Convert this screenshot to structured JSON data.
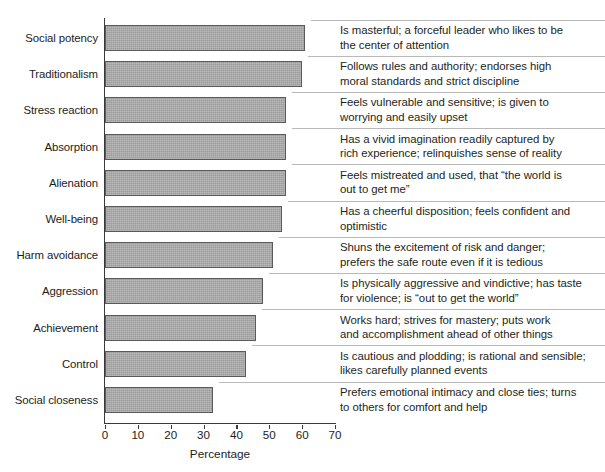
{
  "chart_data": {
    "type": "bar",
    "orientation": "horizontal",
    "title": "",
    "xlabel": "Percentage",
    "ylabel": "",
    "xlim": [
      0,
      70
    ],
    "xticks": [
      0,
      10,
      20,
      30,
      40,
      50,
      60,
      70
    ],
    "grid": false,
    "legend": "none",
    "bar_color": "#a6a6a6",
    "bar_edge_color": "#5a5a5a",
    "axis_color": "#3a3a3a",
    "rule_color": "#b9b9b9",
    "categories": [
      "Social potency",
      "Traditionalism",
      "Stress reaction",
      "Absorption",
      "Alienation",
      "Well-being",
      "Harm avoidance",
      "Aggression",
      "Achievement",
      "Control",
      "Social closeness"
    ],
    "values": [
      61,
      60,
      55,
      55,
      55,
      54,
      51,
      48,
      46,
      43,
      33
    ],
    "annotations": [
      [
        "Is masterful; a forceful leader who likes to be",
        "the center of attention"
      ],
      [
        "Follows rules and authority; endorses high",
        "moral standards and strict discipline"
      ],
      [
        "Feels vulnerable and sensitive; is given to",
        "worrying and easily upset"
      ],
      [
        "Has a vivid imagination readily captured by",
        "rich experience; relinquishes sense of reality"
      ],
      [
        "Feels mistreated and used, that “the world is",
        "out to get me”"
      ],
      [
        "Has a cheerful disposition; feels confident and",
        "optimistic"
      ],
      [
        "Shuns the excitement of risk and danger;",
        "prefers the safe route even if it is tedious"
      ],
      [
        "Is physically aggressive and vindictive; has taste",
        "for violence; is “out to get the world”"
      ],
      [
        "Works hard; strives for mastery; puts work",
        "and accomplishment ahead of other things"
      ],
      [
        "Is cautious and plodding; is rational and sensible;",
        "likes carefully planned events"
      ],
      [
        "Prefers emotional intimacy and close ties; turns",
        "to others for comfort and help"
      ]
    ]
  }
}
